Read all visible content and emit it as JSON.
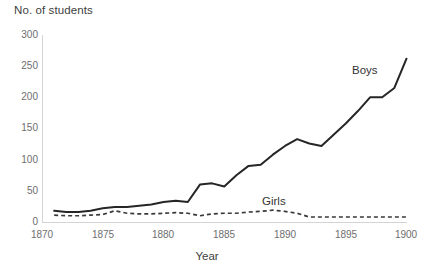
{
  "chart_data": {
    "type": "line",
    "title": "",
    "ylabel": "No. of students",
    "xlabel": "Year",
    "xlim": [
      1870,
      1900
    ],
    "ylim": [
      0,
      300
    ],
    "x_ticks": [
      1870,
      1875,
      1880,
      1885,
      1890,
      1895,
      1900
    ],
    "y_ticks": [
      0,
      50,
      100,
      150,
      200,
      250,
      300
    ],
    "grid": false,
    "legend_position": "inline-annotation",
    "x": [
      1871,
      1872,
      1873,
      1874,
      1875,
      1876,
      1877,
      1878,
      1879,
      1880,
      1881,
      1882,
      1883,
      1884,
      1885,
      1886,
      1887,
      1888,
      1889,
      1890,
      1891,
      1892,
      1893,
      1894,
      1895,
      1896,
      1897,
      1898,
      1899,
      1900
    ],
    "series": [
      {
        "name": "Boys",
        "style": "solid",
        "color": "#262626",
        "values": [
          18,
          16,
          16,
          18,
          22,
          24,
          24,
          26,
          28,
          32,
          34,
          32,
          60,
          62,
          57,
          75,
          90,
          92,
          108,
          122,
          133,
          126,
          122,
          140,
          158,
          178,
          200,
          200,
          215,
          262
        ]
      },
      {
        "name": "Girls",
        "style": "dashed",
        "color": "#3a3a3a",
        "values": [
          11,
          10,
          10,
          11,
          12,
          18,
          14,
          13,
          13,
          14,
          15,
          14,
          10,
          13,
          14,
          14,
          16,
          17,
          19,
          17,
          14,
          8,
          8,
          8,
          8,
          8,
          8,
          8,
          8,
          8
        ]
      }
    ],
    "annotations": [
      {
        "text": "Boys",
        "x": 1899,
        "y": 235
      },
      {
        "text": "Girls",
        "x": 1888,
        "y": 42
      }
    ]
  },
  "axis": {
    "y_title": "No. of students",
    "x_title": "Year",
    "y_labels": [
      "300",
      "250",
      "200",
      "150",
      "100",
      "50",
      "0"
    ],
    "x_labels": [
      "1870",
      "1875",
      "1880",
      "1885",
      "1890",
      "1895",
      "1900"
    ]
  },
  "labels": {
    "boys": "Boys",
    "girls": "Girls"
  },
  "colors": {
    "boys_line": "#262626",
    "girls_line": "#3a3a3a",
    "axis": "#d4d4d4",
    "tick_text": "#6e6e6e",
    "title_text": "#404040",
    "background": "#ffffff"
  }
}
